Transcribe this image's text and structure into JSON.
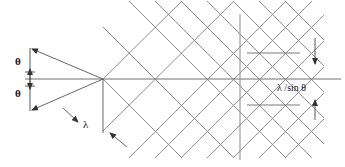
{
  "figure": {
    "type": "wave-interference-diffraction-diagram",
    "background_color": "#ffffff",
    "line_color": "#6e6e6e",
    "axis_color": "#707070",
    "text_color": "#111111"
  },
  "labels": {
    "theta_upper": "θ",
    "theta_lower": "θ",
    "wavelength": "λ",
    "spacing": "λ /sin θ"
  },
  "geometry": {
    "source_vertex": {
      "x": 103,
      "y": 79
    },
    "axis": {
      "x1": 25,
      "y1": 79,
      "x2": 341,
      "y2": 79
    },
    "lattice": {
      "rows": 5,
      "columns": 6,
      "period_x": 52,
      "period_y": 52,
      "slope": 1.0,
      "x_start": 103,
      "y_center": 79
    },
    "vertical_reference_line": {
      "x": 240,
      "y1": 14,
      "y2": 160
    },
    "lambda_drop_line": {
      "x": 103,
      "y1": 79,
      "y2": 133
    },
    "dimension_arrow_right": {
      "x": 315,
      "y1": 38,
      "y2": 114
    },
    "angle_rays": [
      {
        "from": [
          103,
          79
        ],
        "to": [
          30,
          48
        ]
      },
      {
        "from": [
          103,
          79
        ],
        "to": [
          30,
          111
        ]
      }
    ],
    "theta_dimension_line": {
      "x": 30,
      "y1": 48,
      "y2": 111
    },
    "tick_upper": {
      "x1": 247,
      "y1": 53,
      "x2": 300,
      "y2": 53
    },
    "tick_lower": {
      "x1": 247,
      "y1": 105,
      "x2": 300,
      "y2": 105
    }
  }
}
